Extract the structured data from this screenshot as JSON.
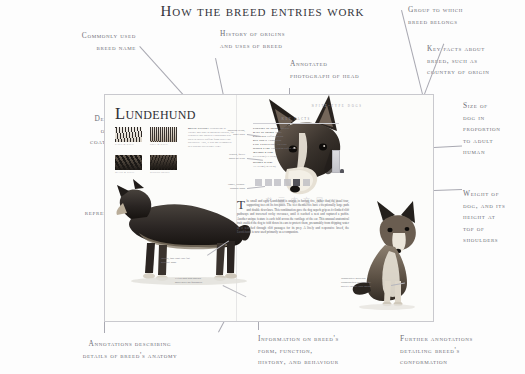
{
  "title": "How the breed entries work",
  "callouts": {
    "commonly_used_breed_name": "Commonly used\nbreed name",
    "description_of_coat": "Description\nof breed's\ncoat colours",
    "healthy_representative": "Healthy\nrepresentative\nof breed",
    "annotations_anatomy": "Annotations describing\ndetails of  breed's anatomy",
    "history_of_origins": "History of origins\nand uses of breed",
    "annotated_photograph": "Annotated\nphotograph of head",
    "group_to_which": "Group to which\nbreed belongs",
    "key_facts_about": "Key facts about\nbreed, such as\ncountry of origin",
    "size_of_dog": "Size of\ndog in\nproportion\nto adult\nhuman",
    "weight_of_dog": "Weight of\ndog, and its\nheight at\ntop of\nshoulders",
    "information_on_breed": "Information on breed's\nform, function,\nhistory, and behaviour",
    "further_annotations": "Further annotations\ndetailing breed's\nconformation"
  },
  "spread": {
    "breed_name": "Lundehund",
    "section_header": "Spitz-type dogs",
    "watermark": "书 画 本 文 网 ID",
    "coat_swatches": [
      {
        "label": "Sable & white"
      },
      {
        "label": "Grey & white"
      },
      {
        "label": "Black & white"
      },
      {
        "label": "Reddish brown"
      }
    ],
    "history": {
      "heading": "Breed history",
      "text": "Originating in Vaeroy and Rost in northern Norway, for centuries this isolated Lundehund was used to collect puffins from turret-top precipices. Ably, it was not recognized as a distinct breed until 1943."
    },
    "key_facts": {
      "heading": "Key facts",
      "rows": [
        {
          "label": "Country of origin",
          "value": "Norway"
        },
        {
          "label": "Date of origin",
          "value": "1500s"
        },
        {
          "label": "First use",
          "value": "Puffin hunting"
        },
        {
          "label": "Use today",
          "value": "Companion"
        },
        {
          "label": "Life expectancy",
          "value": "12 years"
        },
        {
          "label": "Other name",
          "value": "Norwegian Puffin Dog"
        }
      ]
    },
    "measures": [
      {
        "label": "Weight range",
        "value": "5.9-6.8 kg (13-15 lb)"
      },
      {
        "label": "Height range",
        "value": "31-39 cm (12-15 in)"
      }
    ],
    "body_copy": {
      "drop_cap": "T",
      "text": "he small and agile Lundehund is unique in having five, rather than the usual four, supporting toes on its forepaws. The feet themselves have exceptionally large pads and double dewclaws. This combination gave the dog superb grip as it climbed cliff pathways and traversed rocky crevasses, until it reached a nest and captured a puffin. Another unique feature is each fold across the cartilage of the ear. This unusual anatomical trait enabled the dog to fold down its ears to protect them, presumably from dripping water as it searched through cliff passages for its prey. A lively and responsive breed, the Lundehund is now used primarily as a companion."
    },
    "head_annotations": [
      "Medium-sized,\nerect ears",
      "Brown, fairly\ndeep-set eyes",
      "Small, wedge-\nshaped head"
    ],
    "body_annotations": [
      "Dense, top-coat lies flat\nagainst body",
      "Extra pad and double\ndewclaws on forepaws",
      "Moderately muscled\nhindquarters suitable for\nagility rather than speed"
    ]
  },
  "colors": {
    "ink": "#35353c",
    "annotation": "#6f6f78",
    "rule": "#a9a9b2",
    "page_bg": "#fcfcfa",
    "border": "#c9c9ce"
  }
}
